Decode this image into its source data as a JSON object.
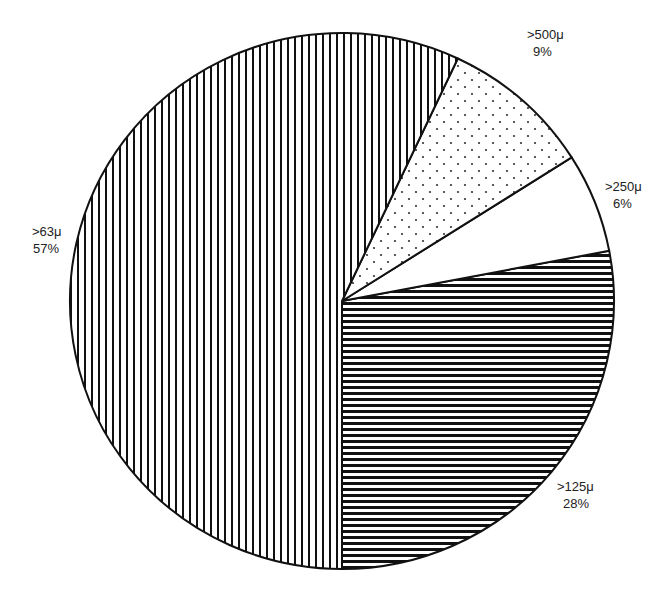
{
  "chart_data": {
    "type": "pie",
    "title": "",
    "start_angle_deg_from_top": 180,
    "direction": "counterclockwise",
    "slices": [
      {
        "label": ">125μ",
        "value": 28,
        "pct_label": "28%",
        "pattern": "horizontal-lines"
      },
      {
        "label": ">250μ",
        "value": 6,
        "pct_label": "6%",
        "pattern": "blank"
      },
      {
        "label": ">500μ",
        "value": 9,
        "pct_label": "9%",
        "pattern": "dots"
      },
      {
        "label": ">63μ",
        "value": 57,
        "pct_label": "57%",
        "pattern": "vertical-lines"
      }
    ],
    "legend": "none (inline labels)"
  },
  "labels": {
    "s125": {
      "name": ">125μ",
      "pct": "28%"
    },
    "s250": {
      "name": ">250μ",
      "pct": "6%"
    },
    "s500": {
      "name": ">500μ",
      "pct": "9%"
    },
    "s63": {
      "name": ">63μ",
      "pct": "57%"
    }
  },
  "colors": {
    "stroke": "#111111",
    "fill_bg": "#ffffff",
    "pattern_ink": "#111111"
  }
}
